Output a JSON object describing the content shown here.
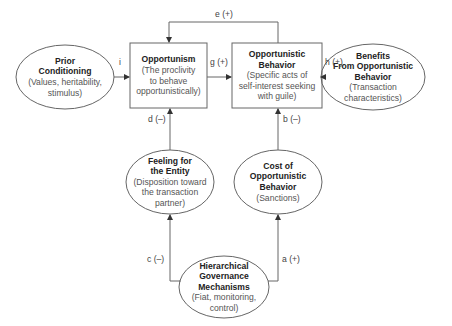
{
  "diagram": {
    "nodes": {
      "prior_conditioning": {
        "title_lines": [
          "Prior",
          "Conditioning"
        ],
        "sub_lines": [
          "(Values, heritability,",
          "stimulus)"
        ],
        "shape": "ellipse"
      },
      "opportunism": {
        "title_lines": [
          "Opportunism"
        ],
        "sub_lines": [
          "(The proclivity",
          "to behave",
          "opportunistically)"
        ],
        "shape": "rectangle"
      },
      "opportunistic_behavior": {
        "title_lines": [
          "Opportunistic",
          "Behavior"
        ],
        "sub_lines": [
          "(Specific acts of",
          "self-interest seeking",
          "with guile)"
        ],
        "shape": "rectangle"
      },
      "benefits": {
        "title_lines": [
          "Benefits",
          "From Opportunistic",
          "Behavior"
        ],
        "sub_lines": [
          "(Transaction",
          "characteristics)"
        ],
        "shape": "ellipse"
      },
      "feeling": {
        "title_lines": [
          "Feeling for",
          "the Entity"
        ],
        "sub_lines": [
          "(Disposition toward",
          "the transaction",
          "partner)"
        ],
        "shape": "ellipse"
      },
      "cost": {
        "title_lines": [
          "Cost of",
          "Opportunistic",
          "Behavior"
        ],
        "sub_lines": [
          "(Sanctions)"
        ],
        "shape": "ellipse"
      },
      "hierarchical": {
        "title_lines": [
          "Hierarchical",
          "Governance",
          "Mechanisms"
        ],
        "sub_lines": [
          "(Fiat, monitoring,",
          "control)"
        ],
        "shape": "ellipse"
      }
    },
    "edges": {
      "i": {
        "label": "i",
        "from": "Prior Conditioning",
        "to": "Opportunism"
      },
      "g": {
        "label": "g (+)",
        "from": "Opportunism",
        "to": "Opportunistic Behavior"
      },
      "e": {
        "label": "e (+)",
        "from": "Opportunistic Behavior",
        "to": "Opportunism"
      },
      "h": {
        "label": "h (+)",
        "from": "Benefits From Opportunistic Behavior",
        "to": "Opportunistic Behavior"
      },
      "d": {
        "label": "d (–)",
        "from": "Feeling for the Entity",
        "to": "Opportunism"
      },
      "b": {
        "label": "b (–)",
        "from": "Cost of Opportunistic Behavior",
        "to": "Opportunistic Behavior"
      },
      "c": {
        "label": "c (–)",
        "from": "Hierarchical Governance Mechanisms",
        "to": "Feeling for the Entity"
      },
      "a": {
        "label": "a (+)",
        "from": "Hierarchical Governance Mechanisms",
        "to": "Cost of Opportunistic Behavior"
      }
    },
    "colors": {
      "stroke": "#555555",
      "text": "#333333"
    }
  }
}
